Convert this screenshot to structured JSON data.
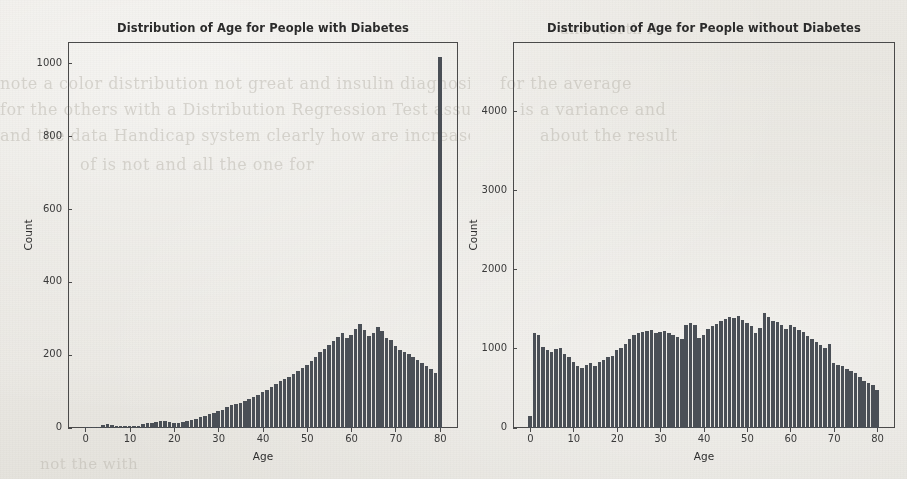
{
  "figure": {
    "background_color": "#e8e6e1",
    "bar_color": "#4a4f56",
    "axis_color": "#4a4a4a",
    "ghost_text": [
      "note a color distribution not great and insulin diagnosis",
      "for the average",
      "for the others with a Distribution Regression Test assumption",
      "is a variance and",
      "and the data Handicap system clearly how are increased",
      "about the result",
      "of is not and all the one for",
      "and worth it.",
      "not the with"
    ]
  },
  "chart_data": [
    {
      "type": "bar",
      "subplot": "left",
      "title": "Distribution of Age for People with Diabetes",
      "xlabel": "Age",
      "ylabel": "Count",
      "xlim": [
        -4,
        84
      ],
      "ylim": [
        0,
        1060
      ],
      "xticks": [
        0,
        10,
        20,
        30,
        40,
        50,
        60,
        70,
        80
      ],
      "yticks": [
        0,
        200,
        400,
        600,
        800,
        1000
      ],
      "grid": false,
      "legend": null,
      "bin_width": 1,
      "categories": [
        0,
        1,
        2,
        3,
        4,
        5,
        6,
        7,
        8,
        9,
        10,
        11,
        12,
        13,
        14,
        15,
        16,
        17,
        18,
        19,
        20,
        21,
        22,
        23,
        24,
        25,
        26,
        27,
        28,
        29,
        30,
        31,
        32,
        33,
        34,
        35,
        36,
        37,
        38,
        39,
        40,
        41,
        42,
        43,
        44,
        45,
        46,
        47,
        48,
        49,
        50,
        51,
        52,
        53,
        54,
        55,
        56,
        57,
        58,
        59,
        60,
        61,
        62,
        63,
        64,
        65,
        66,
        67,
        68,
        69,
        70,
        71,
        72,
        73,
        74,
        75,
        76,
        77,
        78,
        79,
        80
      ],
      "values": [
        2,
        2,
        2,
        3,
        8,
        10,
        7,
        6,
        6,
        5,
        5,
        6,
        5,
        10,
        13,
        14,
        16,
        18,
        20,
        16,
        14,
        13,
        16,
        20,
        22,
        26,
        30,
        32,
        38,
        42,
        46,
        50,
        58,
        62,
        66,
        70,
        74,
        80,
        86,
        92,
        98,
        104,
        112,
        120,
        128,
        134,
        140,
        148,
        156,
        164,
        172,
        184,
        196,
        208,
        218,
        228,
        240,
        250,
        262,
        248,
        256,
        272,
        286,
        268,
        252,
        262,
        278,
        266,
        248,
        242,
        226,
        214,
        208,
        202,
        196,
        186,
        178,
        170,
        162,
        150,
        1020
      ]
    },
    {
      "type": "bar",
      "subplot": "right",
      "title": "Distribution of Age for People without Diabetes",
      "xlabel": "Age",
      "ylabel": "Count",
      "xlim": [
        -4,
        84
      ],
      "ylim": [
        0,
        4880
      ],
      "xticks": [
        0,
        10,
        20,
        30,
        40,
        50,
        60,
        70,
        80
      ],
      "yticks": [
        0,
        1000,
        2000,
        3000,
        4000
      ],
      "grid": false,
      "legend": null,
      "bin_width": 1,
      "categories": [
        0,
        1,
        2,
        3,
        4,
        5,
        6,
        7,
        8,
        9,
        10,
        11,
        12,
        13,
        14,
        15,
        16,
        17,
        18,
        19,
        20,
        21,
        22,
        23,
        24,
        25,
        26,
        27,
        28,
        29,
        30,
        31,
        32,
        33,
        34,
        35,
        36,
        37,
        38,
        39,
        40,
        41,
        42,
        43,
        44,
        45,
        46,
        47,
        48,
        49,
        50,
        51,
        52,
        53,
        54,
        55,
        56,
        57,
        58,
        59,
        60,
        61,
        62,
        63,
        64,
        65,
        66,
        67,
        68,
        69,
        70,
        71,
        72,
        73,
        74,
        75,
        76,
        77,
        78,
        79,
        80
      ],
      "values": [
        150,
        1200,
        1180,
        1020,
        980,
        960,
        1000,
        1010,
        940,
        900,
        830,
        780,
        760,
        800,
        820,
        790,
        830,
        860,
        900,
        910,
        980,
        1010,
        1060,
        1120,
        1180,
        1200,
        1210,
        1230,
        1240,
        1200,
        1220,
        1230,
        1200,
        1180,
        1150,
        1130,
        1300,
        1330,
        1300,
        1140,
        1180,
        1250,
        1290,
        1320,
        1350,
        1380,
        1400,
        1390,
        1420,
        1370,
        1330,
        1290,
        1200,
        1260,
        1450,
        1400,
        1350,
        1340,
        1300,
        1250,
        1300,
        1280,
        1240,
        1220,
        1160,
        1120,
        1090,
        1050,
        1010,
        1060,
        820,
        800,
        780,
        750,
        720,
        690,
        640,
        600,
        570,
        540,
        480,
        4780
      ]
    }
  ]
}
